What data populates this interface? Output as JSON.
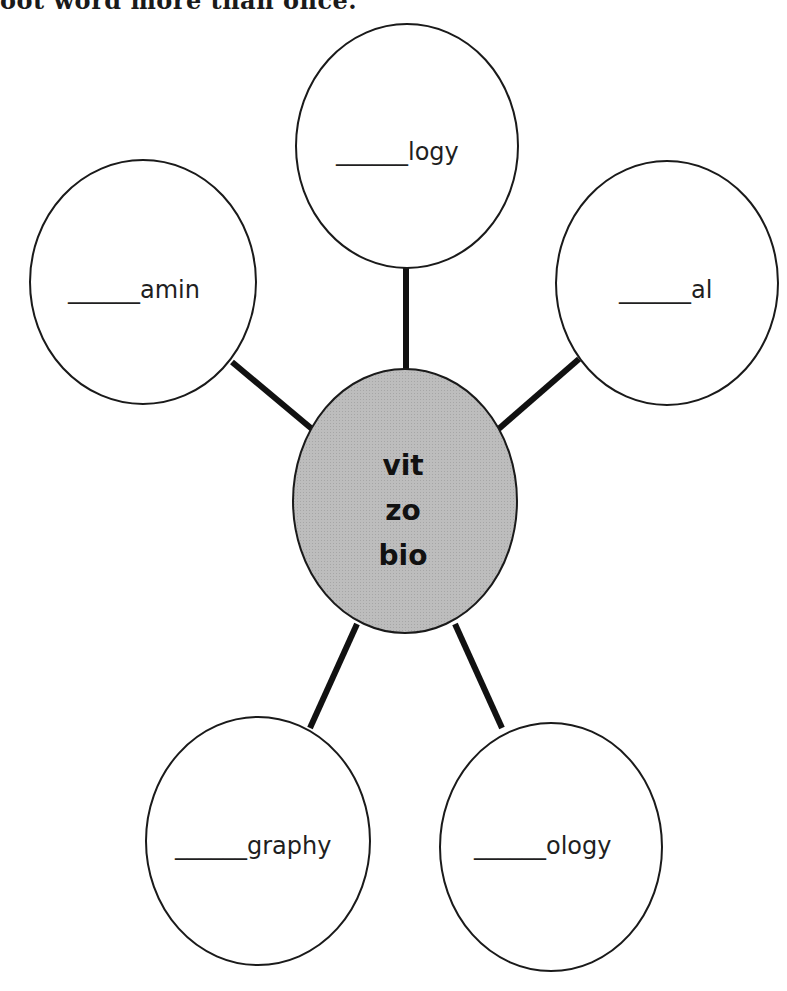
{
  "instruction_text": "oot word more than once.",
  "colors": {
    "center_fill": "#b8b8b8",
    "outline": "#1a1a1a",
    "connector": "#111111"
  },
  "center": {
    "roots": [
      "vit",
      "zo",
      "bio"
    ]
  },
  "nodes": [
    {
      "position": "top",
      "blank": "______",
      "suffix": "logy"
    },
    {
      "position": "left",
      "blank": "______",
      "suffix": "amin"
    },
    {
      "position": "right",
      "blank": "______",
      "suffix": "al"
    },
    {
      "position": "bottom-left",
      "blank": "______",
      "suffix": "graphy"
    },
    {
      "position": "bottom-right",
      "blank": "______",
      "suffix": "ology"
    }
  ]
}
